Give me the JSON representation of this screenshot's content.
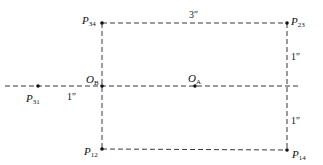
{
  "diagram": {
    "points": {
      "P34": {
        "base": "P",
        "sub": "34",
        "x": 102,
        "y": 23
      },
      "P23": {
        "base": "P",
        "sub": "23",
        "x": 287,
        "y": 23
      },
      "OB": {
        "base": "O",
        "sub": "B",
        "x": 102,
        "y": 86
      },
      "OA": {
        "base": "O",
        "sub": "A",
        "x": 195,
        "y": 86
      },
      "P31": {
        "base": "P",
        "sub": "31",
        "x": 38,
        "y": 86
      },
      "P12": {
        "base": "P",
        "sub": "12",
        "x": 102,
        "y": 149
      },
      "P14": {
        "base": "P",
        "sub": "14",
        "x": 287,
        "y": 150
      }
    },
    "dimensions": {
      "top_width": "3″",
      "right_upper": "1″",
      "right_lower": "1″",
      "left_offset": "1″"
    },
    "colors": {
      "line": "#222222",
      "text": "#111111",
      "background": "#ffffff"
    }
  }
}
